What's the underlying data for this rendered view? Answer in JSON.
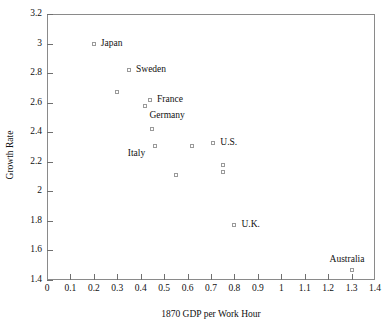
{
  "chart_data": {
    "type": "scatter",
    "title": "",
    "xlabel": "1870 GDP per Work Hour",
    "ylabel": "Growth Rate",
    "xlim": [
      0,
      1.4
    ],
    "ylim": [
      1.4,
      3.2
    ],
    "grid": false,
    "legend": "none",
    "x_ticks": [
      "0",
      "0.1",
      "0.2",
      "0.3",
      "0.4",
      "0.5",
      "0.6",
      "0.7",
      "0.8",
      "0.9",
      "1",
      "1.1",
      "1.2",
      "1.3",
      "1.4"
    ],
    "x_tick_values": [
      0,
      0.1,
      0.2,
      0.3,
      0.4,
      0.5,
      0.6,
      0.7,
      0.8,
      0.9,
      1.0,
      1.1,
      1.2,
      1.3,
      1.4
    ],
    "y_ticks": [
      "1.4",
      "1.6",
      "1.8",
      "2",
      "2.2",
      "2.4",
      "2.6",
      "2.8",
      "3",
      "3.2"
    ],
    "y_tick_values": [
      1.4,
      1.6,
      1.8,
      2.0,
      2.2,
      2.4,
      2.6,
      2.8,
      3.0,
      3.2
    ],
    "points": [
      {
        "label": "Japan",
        "x": 0.2,
        "y": 3.0,
        "label_pos": "right"
      },
      {
        "label": "Sweden",
        "x": 0.35,
        "y": 2.82,
        "label_pos": "right"
      },
      {
        "label": "",
        "x": 0.3,
        "y": 2.67,
        "label_pos": "none"
      },
      {
        "label": "France",
        "x": 0.44,
        "y": 2.62,
        "label_pos": "right"
      },
      {
        "label": "Germany",
        "x": 0.42,
        "y": 2.58,
        "label_pos": "below-right"
      },
      {
        "label": "",
        "x": 0.45,
        "y": 2.42,
        "label_pos": "none"
      },
      {
        "label": "Italy",
        "x": 0.46,
        "y": 2.31,
        "label_pos": "left-below"
      },
      {
        "label": "",
        "x": 0.55,
        "y": 2.11,
        "label_pos": "none"
      },
      {
        "label": "",
        "x": 0.62,
        "y": 2.31,
        "label_pos": "none"
      },
      {
        "label": "U.S.",
        "x": 0.71,
        "y": 2.33,
        "label_pos": "right"
      },
      {
        "label": "",
        "x": 0.75,
        "y": 2.18,
        "label_pos": "none"
      },
      {
        "label": "",
        "x": 0.75,
        "y": 2.13,
        "label_pos": "none"
      },
      {
        "label": "U.K.",
        "x": 0.8,
        "y": 1.77,
        "label_pos": "right"
      },
      {
        "label": "Australia",
        "x": 1.3,
        "y": 1.47,
        "label_pos": "above"
      }
    ],
    "marker_style": "open-square",
    "marker_color": "#9a9a9a",
    "text_color": "#111111",
    "frame_color": "#8a8a8a"
  }
}
